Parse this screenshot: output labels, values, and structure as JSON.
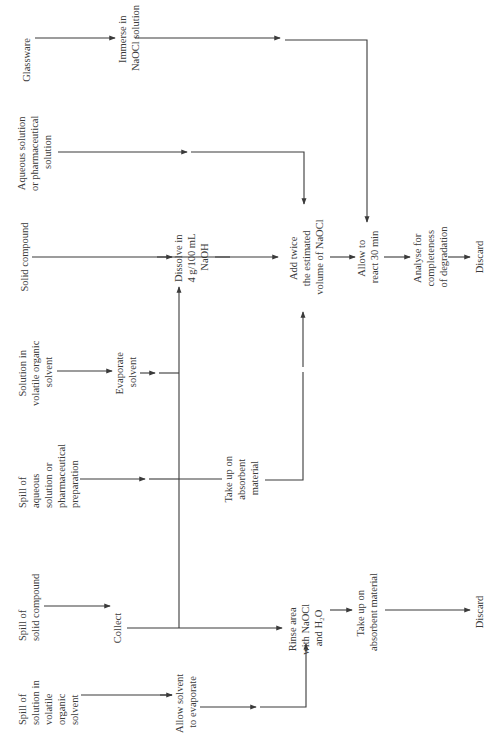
{
  "diagram": {
    "orientation": "rotated-90-ccw",
    "title": "",
    "sources": {
      "spill_volatile": [
        "Spill of",
        "solution in",
        "volatile",
        "organic",
        "solvent"
      ],
      "spill_solid": [
        "Spill of",
        "solid compound"
      ],
      "spill_aqueous": [
        "Spill of",
        "aqueous",
        "solution or",
        "pharmaceutical",
        "preparation"
      ],
      "solution_volatile": [
        "Solution in",
        "volatile organic",
        "solvent"
      ],
      "solid_compound": [
        "Solid compound"
      ],
      "aqueous_solution": [
        "Aqueous solution",
        "or pharmaceutical",
        "solution"
      ],
      "glassware": [
        "Glassware"
      ]
    },
    "steps": {
      "allow_evaporate": [
        "Allow solvent",
        "to evaporate"
      ],
      "collect": [
        "Collect"
      ],
      "take_up_absorbent_1": [
        "Take up on",
        "absorbent",
        "material"
      ],
      "evaporate_solvent": [
        "Evaporate",
        "solvent"
      ],
      "dissolve_naoh": [
        "Dissolve in",
        "4 g/100 mL",
        "NaOH"
      ],
      "immerse_naocl": [
        "Immerse in",
        "NaOCl solution"
      ],
      "rinse_area": [
        "Rinse area",
        "with NaOCl",
        "and H₂O"
      ],
      "take_up_absorbent_2": [
        "Take up on",
        "absorbent material"
      ],
      "add_twice": [
        "Add twice",
        "the estimated",
        "volume of NaOCl"
      ],
      "allow_react": [
        "Allow to",
        "react 30 min"
      ],
      "analyse": [
        "Analyse for",
        "completeness",
        "of degradation"
      ],
      "discard_1": [
        "Discard"
      ],
      "discard_2": [
        "Discard"
      ]
    },
    "colors": {
      "line": "#3a3a3a",
      "text": "#3a3a3a",
      "background": "#ffffff"
    }
  }
}
